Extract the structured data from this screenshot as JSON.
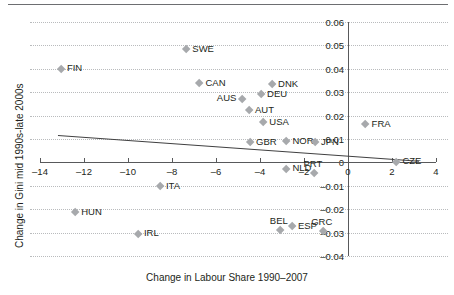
{
  "chart_data": {
    "type": "scatter",
    "title": "",
    "xlabel": "Change in Labour Share 1990–2007",
    "ylabel": "Change in Gini mid 1990s-late 2000s",
    "xlim": [
      -14,
      4
    ],
    "ylim": [
      -0.04,
      0.06
    ],
    "xticks": [
      "–14",
      "–12",
      "–10",
      "–8",
      "–6",
      "–4",
      "–2",
      "0",
      "2",
      "4"
    ],
    "xtick_values": [
      -14,
      -12,
      -10,
      -8,
      -6,
      -4,
      -2,
      0,
      2,
      4
    ],
    "yticks": [
      "0.06",
      "0.05",
      "0.04",
      "0.03",
      "0.02",
      "0.01",
      "0",
      "–0.01",
      "–0.02",
      "–0.03",
      "–0.04"
    ],
    "ytick_values": [
      0.06,
      0.05,
      0.04,
      0.03,
      0.02,
      0.01,
      0,
      -0.01,
      -0.02,
      -0.03,
      -0.04
    ],
    "grid": "horizontal-dotted",
    "legend": "none",
    "marker_color": "#a7a9ac",
    "marker_shape": "diamond",
    "trendline": {
      "x0": -13.2,
      "y0": 0.0118,
      "x1": 3.2,
      "y1": 0.0008,
      "color": "#404041"
    },
    "points": [
      {
        "label": "FIN",
        "x": -13.05,
        "y": 0.04,
        "label_pos": "right"
      },
      {
        "label": "SWE",
        "x": -7.35,
        "y": 0.0482,
        "label_pos": "right"
      },
      {
        "label": "CAN",
        "x": -6.75,
        "y": 0.0337,
        "label_pos": "right"
      },
      {
        "label": "DNK",
        "x": -3.45,
        "y": 0.0333,
        "label_pos": "right"
      },
      {
        "label": "DEU",
        "x": -3.95,
        "y": 0.029,
        "label_pos": "right"
      },
      {
        "label": "AUS",
        "x": -4.8,
        "y": 0.0272,
        "label_pos": "left"
      },
      {
        "label": "AUT",
        "x": -4.5,
        "y": 0.0222,
        "label_pos": "right"
      },
      {
        "label": "USA",
        "x": -3.85,
        "y": 0.017,
        "label_pos": "right"
      },
      {
        "label": "FRA",
        "x": 0.8,
        "y": 0.0163,
        "label_pos": "right"
      },
      {
        "label": "GBR",
        "x": -4.45,
        "y": 0.0085,
        "label_pos": "right"
      },
      {
        "label": "NOR",
        "x": -2.8,
        "y": 0.009,
        "label_pos": "right"
      },
      {
        "label": "JPN",
        "x": -1.5,
        "y": 0.0085,
        "label_pos": "right"
      },
      {
        "label": "CZE",
        "x": 2.2,
        "y": 0.0002,
        "label_pos": "right"
      },
      {
        "label": "NLD",
        "x": -2.8,
        "y": -0.0027,
        "label_pos": "right"
      },
      {
        "label": "PRT",
        "x": -1.55,
        "y": -0.0045,
        "label_pos": "above"
      },
      {
        "label": "ITA",
        "x": -8.55,
        "y": -0.0103,
        "label_pos": "right"
      },
      {
        "label": "HUN",
        "x": -12.4,
        "y": -0.0212,
        "label_pos": "right"
      },
      {
        "label": "BEL",
        "x": -3.1,
        "y": -0.0288,
        "label_pos": "above"
      },
      {
        "label": "ESP",
        "x": -2.55,
        "y": -0.0272,
        "label_pos": "right"
      },
      {
        "label": "GRC",
        "x": -1.15,
        "y": -0.0292,
        "label_pos": "above"
      },
      {
        "label": "IRL",
        "x": -9.55,
        "y": -0.0305,
        "label_pos": "right"
      }
    ]
  }
}
